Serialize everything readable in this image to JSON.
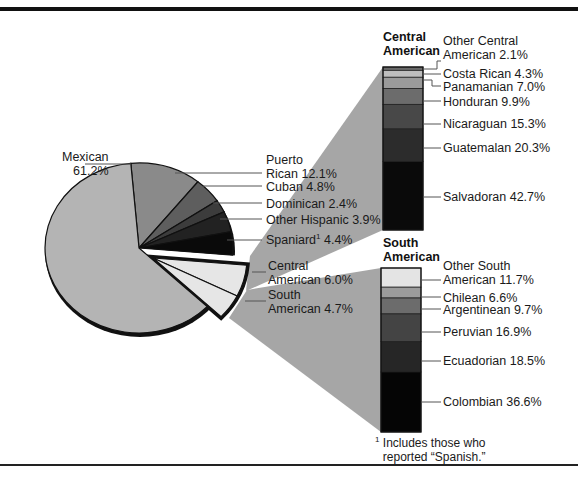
{
  "chart_data": [
    {
      "type": "pie",
      "title": "",
      "categories": [
        "Puerto Rican",
        "Cuban",
        "Dominican",
        "Other Hispanic",
        "Spaniard",
        "Central American",
        "South American",
        "Mexican"
      ],
      "values": [
        12.1,
        4.8,
        2.4,
        3.9,
        4.4,
        6.0,
        4.7,
        61.2
      ],
      "unit": "%",
      "exploded": [
        "Central American",
        "South American"
      ],
      "colors": [
        "#8a8a8a",
        "#5e5e5e",
        "#3c3c3c",
        "#222222",
        "#0a0a0a",
        "#e6e6e6",
        "#e6e6e6",
        "#b4b4b4"
      ],
      "labels": [
        {
          "name": "Mexican",
          "text": "Mexican\n61.2%"
        },
        {
          "name": "Puerto Rican",
          "text": "Puerto\nRican 12.1%"
        },
        {
          "name": "Cuban",
          "text": "Cuban 4.8%"
        },
        {
          "name": "Dominican",
          "text": "Dominican 2.4%"
        },
        {
          "name": "Other Hispanic",
          "text": "Other Hispanic 3.9%"
        },
        {
          "name": "Spaniard",
          "text": "Spaniard",
          "sup": "1",
          "value": "4.4%"
        },
        {
          "name": "Central American",
          "text": "Central\nAmerican 6.0%"
        },
        {
          "name": "South American",
          "text": "South\nAmerican 4.7%"
        }
      ]
    },
    {
      "type": "bar",
      "stacked": true,
      "title": "Central\nAmerican",
      "categories": [
        "Other Central American",
        "Costa Rican",
        "Panamanian",
        "Honduran",
        "Nicaraguan",
        "Guatemalan",
        "Salvadoran"
      ],
      "values": [
        2.1,
        4.3,
        7.0,
        9.9,
        15.3,
        20.3,
        42.7
      ],
      "unit": "%",
      "colors": [
        "#6a6a6a",
        "#bdbdbd",
        "#9a9a9a",
        "#6c6c6c",
        "#484848",
        "#2c2c2c",
        "#0a0a0a"
      ],
      "labels": [
        "Other Central\nAmerican 2.1%",
        "Costa Rican 4.3%",
        "Panamanian 7.0%",
        "Honduran 9.9%",
        "Nicaraguan 15.3%",
        "Guatemalan 20.3%",
        "Salvadoran 42.7%"
      ]
    },
    {
      "type": "bar",
      "stacked": true,
      "title": "South\nAmerican",
      "categories": [
        "Other South American",
        "Chilean",
        "Argentinean",
        "Peruvian",
        "Ecuadorian",
        "Colombian"
      ],
      "values": [
        11.7,
        6.6,
        9.7,
        16.9,
        18.5,
        36.6
      ],
      "unit": "%",
      "colors": [
        "#e4e4e4",
        "#9c9c9c",
        "#6c6c6c",
        "#444444",
        "#262626",
        "#050505"
      ],
      "labels": [
        "Other South\nAmerican 11.7%",
        "Chilean 6.6%",
        "Argentinean 9.7%",
        "Peruvian 16.9%",
        "Ecuadorian 18.5%",
        "Colombian 36.6%"
      ]
    }
  ],
  "footnote": {
    "marker": "1",
    "text": "Includes those who\nreported “Spanish.”"
  },
  "pie_labels": {
    "mexican": "Mexican\n61.2%",
    "puerto_rican": "Puerto\nRican 12.1%",
    "cuban": "Cuban 4.8%",
    "dominican": "Dominican 2.4%",
    "other_hispanic": "Other Hispanic 3.9%",
    "spaniard": "Spaniard",
    "spaniard_sup": "1",
    "spaniard_value": " 4.4%",
    "central": "Central\nAmerican 6.0%",
    "south": "South\nAmerican 4.7%"
  },
  "central_bar": {
    "title": "Central\nAmerican",
    "labels": {
      "other": "Other Central\nAmerican 2.1%",
      "costa_rican": "Costa Rican 4.3%",
      "panamanian": "Panamanian 7.0%",
      "honduran": "Honduran 9.9%",
      "nicaraguan": "Nicaraguan 15.3%",
      "guatemalan": "Guatemalan 20.3%",
      "salvadoran": "Salvadoran 42.7%"
    }
  },
  "south_bar": {
    "title": "South\nAmerican",
    "labels": {
      "other": "Other South\nAmerican 11.7%",
      "chilean": "Chilean 6.6%",
      "argentinean": "Argentinean 9.7%",
      "peruvian": "Peruvian 16.9%",
      "ecuadorian": "Ecuadorian 18.5%",
      "colombian": "Colombian 36.6%"
    }
  }
}
